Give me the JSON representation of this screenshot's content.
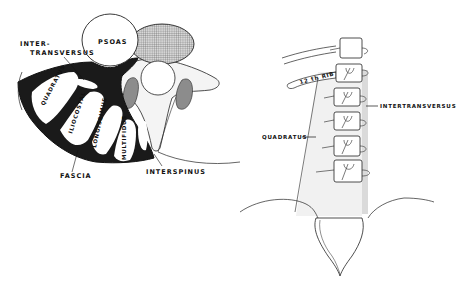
{
  "figure": {
    "left_panel": {
      "description": "Cross-section of lumbar back musculature",
      "labels": {
        "psoas": "PSOAS",
        "intertransversus_line1": "INTER-",
        "intertransversus_line2": "TRANSVERSUS",
        "quadratus": "QUADRATUS",
        "iliocostal": "ILIOCOSTAL",
        "longissimus": "LONGISSIMUS",
        "multifidus": "MULTIFIDUS",
        "fascia": "FASCIA",
        "interspinus": "INTERSPINUS"
      }
    },
    "right_panel": {
      "description": "Posterior view of lumbar spine with 12th rib",
      "labels": {
        "rib": "12 th RIB",
        "intertransversus": "INTERTRANSVERSUS",
        "quadratus": "QUADRATUS"
      }
    },
    "colors": {
      "ink": "#111111",
      "muscle_fill": "#ffffff",
      "fascia_fill": "#1a1a1a",
      "vertebral_body_hatch": "#8a8a8a",
      "facet_fill": "#8c8c8c",
      "bone_fill": "#f4f4f4"
    }
  }
}
